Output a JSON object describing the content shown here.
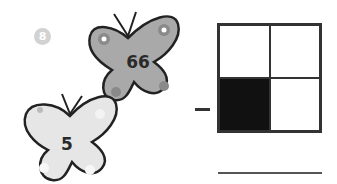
{
  "problem": {
    "number": "8",
    "butterflies": [
      {
        "value": "66",
        "fill": "#a9a9a9"
      },
      {
        "value": "5",
        "fill": "#e6e6e6"
      }
    ],
    "operator": "−",
    "grid": {
      "rows": 2,
      "cols": 2,
      "shaded_cells": [
        [
          1,
          0
        ]
      ],
      "shade_color": "#111111"
    }
  }
}
